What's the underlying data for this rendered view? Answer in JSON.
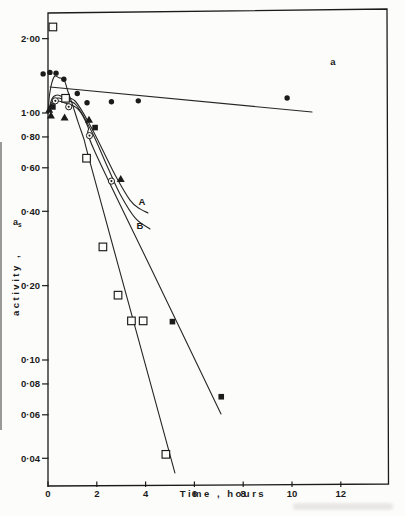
{
  "colors": {
    "ink": "#1b1b1b",
    "line": "#262626",
    "paper": "#fcfcfa"
  },
  "chart_data": {
    "type": "scatter",
    "title": "",
    "xlabel": "Time , hours",
    "ylabel_rotated": "activity ,",
    "ylabel_symbol_base": "a",
    "ylabel_symbol_sub": "s",
    "x_axis": {
      "unit": "hours",
      "range": [
        0,
        13.9
      ],
      "ticks": [
        {
          "label": "0",
          "value": 0
        },
        {
          "label": "2",
          "value": 2
        },
        {
          "label": "4",
          "value": 4
        },
        {
          "label": "6",
          "value": 6
        },
        {
          "label": "8",
          "value": 8
        },
        {
          "label": "10",
          "value": 10
        },
        {
          "label": "12",
          "value": 12
        }
      ]
    },
    "y_axis": {
      "scale": "log",
      "range": [
        0.031,
        2.57
      ],
      "ticks": [
        {
          "label": "2·00",
          "value": 2.0
        },
        {
          "label": "1·00",
          "value": 1.0
        },
        {
          "label": "0·80",
          "value": 0.8
        },
        {
          "label": "0·60",
          "value": 0.6
        },
        {
          "label": "0·40",
          "value": 0.4
        },
        {
          "label": "0·20",
          "value": 0.2
        },
        {
          "label": "0·10",
          "value": 0.1
        },
        {
          "label": "0·08",
          "value": 0.08
        },
        {
          "label": "0·06",
          "value": 0.06
        },
        {
          "label": "0·04",
          "value": 0.04
        }
      ]
    },
    "series": [
      {
        "name": "filled-circle-series",
        "marker": "filled-circle",
        "points": [
          [
            -0.2,
            1.44
          ],
          [
            0.08,
            1.46
          ],
          [
            0.33,
            1.45
          ],
          [
            0.65,
            1.37
          ],
          [
            1.2,
            1.2
          ],
          [
            1.6,
            1.1
          ],
          [
            2.6,
            1.11
          ],
          [
            3.7,
            1.12
          ],
          [
            9.8,
            1.15
          ]
        ]
      },
      {
        "name": "open-circle-dot-series",
        "marker": "circle-dot",
        "points": [
          [
            0.3,
            1.12
          ],
          [
            0.85,
            1.06
          ],
          [
            1.7,
            0.81
          ],
          [
            2.6,
            0.53
          ]
        ]
      },
      {
        "name": "filled-triangle-series",
        "marker": "filled-triangle",
        "points": [
          [
            0.05,
            1.03
          ],
          [
            0.12,
            0.975
          ],
          [
            0.68,
            0.958
          ],
          [
            1.68,
            0.937
          ],
          [
            2.98,
            0.54
          ]
        ]
      },
      {
        "name": "filled-square-series",
        "marker": "filled-square",
        "points": [
          [
            0.2,
            1.058
          ],
          [
            1.93,
            0.873
          ],
          [
            5.1,
            0.143
          ],
          [
            7.1,
            0.071
          ]
        ]
      },
      {
        "name": "open-square-series",
        "marker": "open-square",
        "points": [
          [
            0.2,
            2.23
          ],
          [
            0.72,
            1.147
          ],
          [
            1.58,
            0.656
          ],
          [
            2.25,
            0.287
          ],
          [
            2.87,
            0.183
          ],
          [
            3.42,
            0.144
          ],
          [
            3.9,
            0.144
          ],
          [
            4.83,
            0.0415
          ]
        ]
      }
    ],
    "fit_lines": [
      {
        "name": "line-a",
        "smooth": false,
        "points": [
          [
            0.08,
            1.274
          ],
          [
            10.82,
            1.009
          ]
        ]
      },
      {
        "name": "curve-A",
        "smooth": true,
        "points": [
          [
            0,
            1.0
          ],
          [
            0.16,
            1.14
          ],
          [
            0.37,
            1.183
          ],
          [
            0.61,
            1.161
          ],
          [
            1.11,
            1.118
          ],
          [
            1.72,
            0.894
          ],
          [
            2.34,
            0.676
          ],
          [
            2.75,
            0.561
          ],
          [
            3.36,
            0.444
          ],
          [
            3.77,
            0.409
          ],
          [
            4.1,
            0.394
          ]
        ]
      },
      {
        "name": "curve-B",
        "smooth": true,
        "points": [
          [
            0,
            1.0
          ],
          [
            0.16,
            1.108
          ],
          [
            0.41,
            1.15
          ],
          [
            0.66,
            1.129
          ],
          [
            1.15,
            1.077
          ],
          [
            1.8,
            0.838
          ],
          [
            2.46,
            0.599
          ],
          [
            2.95,
            0.47
          ],
          [
            3.57,
            0.376
          ],
          [
            4.18,
            0.339
          ]
        ]
      },
      {
        "name": "line-through-filled-squares",
        "smooth": true,
        "points": [
          [
            0,
            1.01
          ],
          [
            0.16,
            1.087
          ],
          [
            0.41,
            1.118
          ],
          [
            0.7,
            1.098
          ],
          [
            1.23,
            1.038
          ],
          [
            1.64,
            0.878
          ],
          [
            1.89,
            0.708
          ],
          [
            4.5,
            0.206
          ],
          [
            7.09,
            0.0605
          ]
        ]
      },
      {
        "name": "line-through-open-squares",
        "smooth": true,
        "points": [
          [
            0,
            1.0
          ],
          [
            0.08,
            1.22
          ],
          [
            0.25,
            1.4
          ],
          [
            0.45,
            1.39
          ],
          [
            0.66,
            1.36
          ],
          [
            0.82,
            1.22
          ],
          [
            0.98,
            1.1
          ],
          [
            1.23,
            0.92
          ],
          [
            1.48,
            0.78
          ],
          [
            1.72,
            0.633
          ],
          [
            3.5,
            0.144
          ],
          [
            5.2,
            0.0349
          ]
        ]
      }
    ],
    "annotations": [
      {
        "text": "a",
        "t": 11.68,
        "v": 1.61
      },
      {
        "text": "A",
        "t": 3.85,
        "v": 0.436
      },
      {
        "text": "B",
        "t": 3.77,
        "v": 0.349
      }
    ]
  }
}
